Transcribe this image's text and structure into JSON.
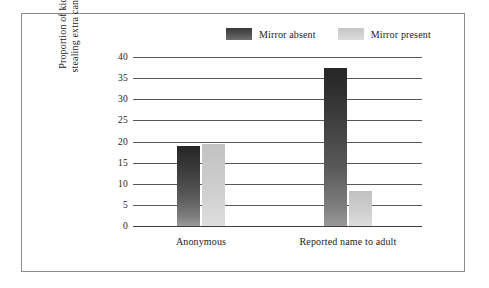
{
  "chart_data": {
    "type": "bar",
    "title": "",
    "subtitle": "",
    "xlabel": "",
    "ylabel": "Proportion of kids stealing extra candy",
    "ylabel_lines": [
      "Proportion of kids",
      "stealing extra candy"
    ],
    "categories": [
      "Anonymous",
      "Reported name to adult"
    ],
    "series": [
      {
        "name": "Mirror absent",
        "values": [
          19.0,
          37.3
        ],
        "color": "#3a3a3a"
      },
      {
        "name": "Mirror present",
        "values": [
          19.3,
          8.3
        ],
        "color": "#cccccc"
      }
    ],
    "ylim": [
      0,
      40
    ],
    "ytick_labels": [
      "0",
      "5",
      "10",
      "15",
      "20",
      "25",
      "30",
      "35",
      "40"
    ],
    "ytick_values": [
      0,
      5,
      10,
      15,
      20,
      25,
      30,
      35,
      40
    ],
    "grid": true,
    "grid_axis": "y",
    "legend_position": "top-center",
    "frame": true,
    "frame_color": "#8d8d8d",
    "background": "#ffffff",
    "gridline_color": "#55595c"
  },
  "legend": {
    "entries": [
      {
        "label": "Mirror absent",
        "swatch": "dark"
      },
      {
        "label": "Mirror present",
        "swatch": "light"
      }
    ]
  }
}
